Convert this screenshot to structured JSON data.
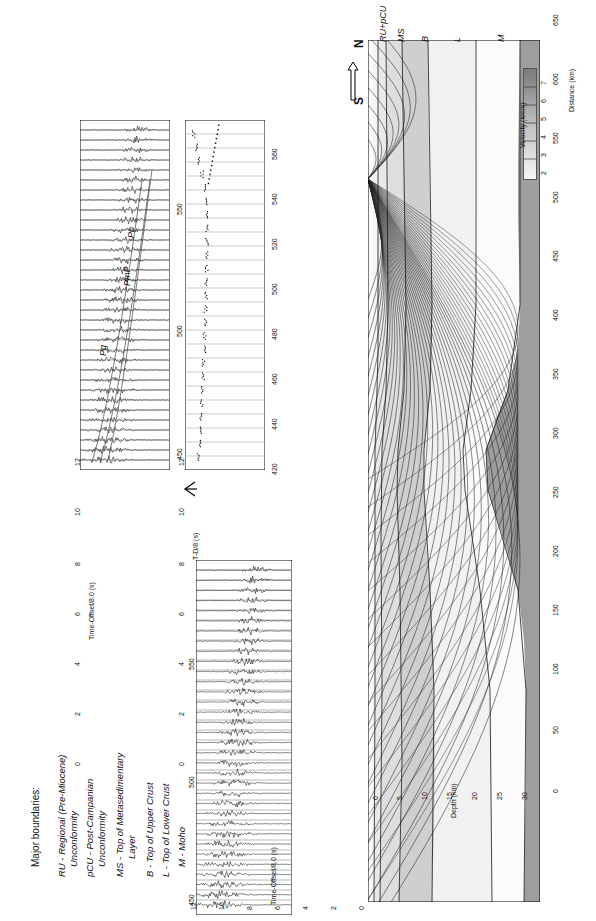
{
  "figure": {
    "orientation": "rotated-90-ccw",
    "background": "#ffffff"
  },
  "legend": {
    "title": "Major boundaries:",
    "items": [
      {
        "code": "RU",
        "text": "RU - Regional (Pre-Miocene)"
      },
      {
        "code": "RU2",
        "text": "Unconformity"
      },
      {
        "code": "pCU",
        "text": "pCU - Post-Campanian"
      },
      {
        "code": "pCU2",
        "text": "Unconformity"
      },
      {
        "code": "MS",
        "text": "MS - Top of Metasedimentary"
      },
      {
        "code": "MS2",
        "text": "Layer"
      },
      {
        "code": "B",
        "text": "B - Top of Upper Crust"
      },
      {
        "code": "L",
        "text": "L - Top of Lower Crust"
      },
      {
        "code": "M",
        "text": "M - Moho"
      }
    ]
  },
  "panel_top_left": {
    "name": "record-section-observed",
    "ylabel": "Time-Offset/8.0 (s)",
    "yticks": [
      "12",
      "10",
      "8",
      "6",
      "4",
      "2",
      "0"
    ],
    "ylim": [
      0,
      12
    ],
    "xticks": [
      "450",
      "500",
      "550"
    ],
    "xlim": [
      425,
      565
    ],
    "phase_labels": [
      {
        "label": "Pg",
        "x": 0.12,
        "y": 0.62
      },
      {
        "label": "Pn",
        "x": 0.47,
        "y": 0.3
      },
      {
        "label": "PmP",
        "x": 0.41,
        "y": 0.42
      }
    ]
  },
  "panel_middle": {
    "name": "record-section-picks",
    "ylabel": "T-D/8 (s)",
    "yticks": [
      "12",
      "10",
      "8",
      "6",
      "4",
      "2",
      "0"
    ],
    "ylim": [
      0,
      12
    ],
    "xticks": [
      "420",
      "440",
      "460",
      "480",
      "500",
      "520",
      "540",
      "560"
    ],
    "xlim": [
      412,
      568
    ]
  },
  "panel_bottom_left": {
    "name": "record-section-synthetic",
    "ylabel": "Time-Offset/8.0 (s)",
    "yticks": [
      "12",
      "10",
      "8",
      "6",
      "4",
      "2",
      "0"
    ],
    "ylim": [
      0,
      12
    ],
    "xticks": [
      "450",
      "500",
      "550"
    ],
    "xlim": [
      425,
      565
    ]
  },
  "velocity_model": {
    "name": "velocity-model-raytrace",
    "direction_label": "S ⟸ N",
    "direction_from": "S",
    "direction_to": "N",
    "xlabel": "Distance (km)",
    "ylabel": "Depth (km)",
    "xticks": [
      "0",
      "50",
      "100",
      "150",
      "200",
      "250",
      "300",
      "350",
      "400",
      "450",
      "500",
      "550",
      "600",
      "650"
    ],
    "xlim": [
      0,
      650
    ],
    "yticks": [
      "0",
      "5",
      "10",
      "15",
      "20",
      "25",
      "30"
    ],
    "ylim": [
      0,
      32
    ],
    "boundary_labels": [
      {
        "code": "RU+pCU"
      },
      {
        "code": "MS"
      },
      {
        "code": "B"
      },
      {
        "code": "L"
      },
      {
        "code": "M"
      }
    ],
    "colorbar": {
      "title": "Velocity (km/s)",
      "ticks": [
        "2",
        "3",
        "4",
        "5",
        "6",
        "7"
      ],
      "min": 1.8,
      "max": 7.6,
      "colors": [
        "#f2f2f2",
        "#e2e2e2",
        "#d0d0d0",
        "#bdbdbd",
        "#a8a8a8",
        "#949494",
        "#808080"
      ]
    },
    "layer_colors": {
      "water_sediment": "#f4f4f4",
      "sediment_1": "#ebebeb",
      "sediment_2": "#dcdcdc",
      "metased": "#cfcfcf",
      "upper_crust": "#f0f0f0",
      "lower_crust": "#fafafa",
      "mantle": "#9e9e9e",
      "ray_color": "#1a1a1a"
    }
  },
  "chart_data": {
    "type": "line",
    "xlabel": "Distance (km)",
    "ylabel": "Depth (km)",
    "panels": [
      {
        "id": "top-left",
        "type": "record-section",
        "ylabel": "Time-Offset/8.0 (s)",
        "xlabel": "",
        "ylim": [
          0,
          12
        ],
        "xlim": [
          425,
          565
        ],
        "xticks": [
          450,
          500,
          550
        ],
        "yticks": [
          0,
          2,
          4,
          6,
          8,
          10,
          12
        ],
        "annotations": [
          "Pg",
          "Pn",
          "PmP"
        ],
        "trace_count": 34
      },
      {
        "id": "middle",
        "type": "scatter",
        "ylabel": "T-D/8 (s)",
        "ylim": [
          0,
          12
        ],
        "xlim": [
          412,
          568
        ],
        "xticks": [
          420,
          440,
          460,
          480,
          500,
          520,
          540,
          560
        ],
        "yticks": [
          0,
          2,
          4,
          6,
          8,
          10,
          12
        ],
        "description": "Travel-time picks, curved branch from ~10 s at 420 km dipping to ~8 s near 545 km",
        "picks_x": [
          418,
          424,
          430,
          436,
          442,
          448,
          454,
          460,
          466,
          472,
          478,
          484,
          490,
          496,
          502,
          508,
          514,
          520,
          526,
          532,
          538,
          544,
          550,
          556,
          562
        ],
        "picks_y": [
          10.0,
          9.9,
          9.8,
          9.7,
          9.6,
          9.5,
          9.4,
          9.3,
          9.2,
          9.1,
          9.05,
          9.0,
          8.95,
          8.9,
          8.85,
          8.8,
          8.8,
          8.85,
          8.9,
          9.0,
          9.2,
          9.5,
          9.9,
          10.3,
          10.8
        ]
      },
      {
        "id": "bottom-left",
        "type": "record-section",
        "ylabel": "Time-Offset/8.0 (s)",
        "ylim": [
          0,
          12
        ],
        "xlim": [
          425,
          565
        ],
        "xticks": [
          450,
          500,
          550
        ],
        "yticks": [
          0,
          2,
          4,
          6,
          8,
          10,
          12
        ],
        "trace_count": 34
      },
      {
        "id": "velocity-model",
        "type": "heatmap",
        "xlabel": "Distance (km)",
        "ylabel": "Depth (km)",
        "xlim": [
          0,
          650
        ],
        "ylim": [
          0,
          32
        ],
        "xticks": [
          0,
          50,
          100,
          150,
          200,
          250,
          300,
          350,
          400,
          450,
          500,
          550,
          600,
          650
        ],
        "yticks": [
          0,
          5,
          10,
          15,
          20,
          25,
          30
        ],
        "colorbar_range": [
          2,
          7
        ],
        "colorbar_label": "Velocity (km/s)",
        "boundaries": [
          "RU+pCU",
          "MS",
          "B",
          "L",
          "M"
        ],
        "moho_depth_km": [
          29,
          29,
          28.5,
          28,
          27.5,
          27,
          26.5,
          26,
          25,
          23,
          21,
          20,
          19.5,
          19
        ],
        "upper_crust_depth_km": [
          11,
          11,
          11,
          11,
          11.5,
          12,
          12.5,
          13,
          13,
          12,
          11,
          10.5,
          10,
          10
        ],
        "shot_position_km": 545
      }
    ]
  }
}
